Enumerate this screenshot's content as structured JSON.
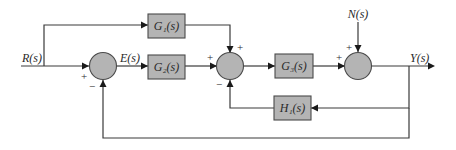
{
  "signals": {
    "input": "R(s)",
    "error": "E(s)",
    "disturbance": "N(s)",
    "output": "Y(s)"
  },
  "blocks": {
    "g1": "G₁(s)",
    "g2": "G₂(s)",
    "g3": "G₃(s)",
    "h1": "H₁(s)"
  },
  "signs": {
    "sum1_input": "+",
    "sum1_feedback": "−",
    "sum2_left": "+",
    "sum2_top": "+",
    "sum2_bottom": "−",
    "sum3_left": "+",
    "sum3_top": "+"
  },
  "colors": {
    "block_fill": "#b4b4b4",
    "line": "#3a3a3a"
  }
}
